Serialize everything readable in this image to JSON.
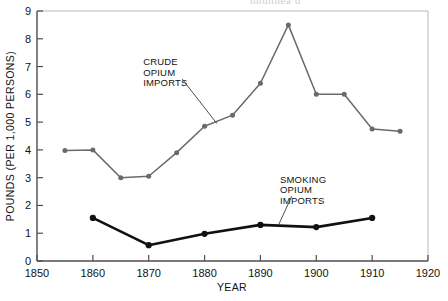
{
  "scan": {
    "top_text_fragment": "nnunnea u"
  },
  "chart_data": {
    "type": "line",
    "title": "",
    "xlabel": "YEAR",
    "ylabel": "POUNDS (PER 1,000 PERSONS)",
    "xlim": [
      1850,
      1920
    ],
    "ylim": [
      0,
      9
    ],
    "xticks": [
      1850,
      1860,
      1870,
      1880,
      1890,
      1900,
      1910,
      1920
    ],
    "xtick_labels": [
      "1850",
      "1860",
      "1870",
      "1880",
      "1890",
      "1900",
      "1910",
      "1920"
    ],
    "yticks": [
      0,
      1,
      2,
      3,
      4,
      5,
      6,
      7,
      8,
      9
    ],
    "ytick_labels": [
      "0",
      "1",
      "2",
      "3",
      "4",
      "5",
      "6",
      "7",
      "8",
      "9"
    ],
    "grid": false,
    "legend": "none",
    "series": [
      {
        "name": "CRUDE OPIUM IMPORTS",
        "color": "#6a6a6a",
        "marker": "circle",
        "x": [
          1855,
          1860,
          1865,
          1870,
          1875,
          1880,
          1885,
          1890,
          1895,
          1900,
          1905,
          1910,
          1915
        ],
        "values": [
          3.98,
          4.0,
          3.0,
          3.05,
          3.9,
          4.85,
          5.25,
          6.4,
          8.5,
          6.0,
          6.0,
          4.75,
          4.67
        ]
      },
      {
        "name": "SMOKING OPIUM IMPORTS",
        "color": "#111111",
        "marker": "circle",
        "x": [
          1860,
          1870,
          1880,
          1890,
          1900,
          1910
        ],
        "values": [
          1.55,
          0.57,
          0.98,
          1.3,
          1.22,
          1.55
        ]
      }
    ],
    "annotations": [
      {
        "id": "crude-annotation",
        "lines": [
          "CRUDE",
          "OPIUM",
          "IMPORTS"
        ],
        "text_x": 1869.0,
        "text_y": 7.05,
        "leader_from": [
          1876.0,
          6.55
        ],
        "leader_to": [
          1882.2,
          4.95
        ]
      },
      {
        "id": "smoking-annotation",
        "lines": [
          "SMOKING",
          "OPIUM",
          "IMPORTS"
        ],
        "text_x": 1893.5,
        "text_y": 2.82,
        "leader_from": [
          1895.6,
          2.33
        ],
        "leader_to": [
          1893.2,
          1.28
        ]
      }
    ]
  }
}
